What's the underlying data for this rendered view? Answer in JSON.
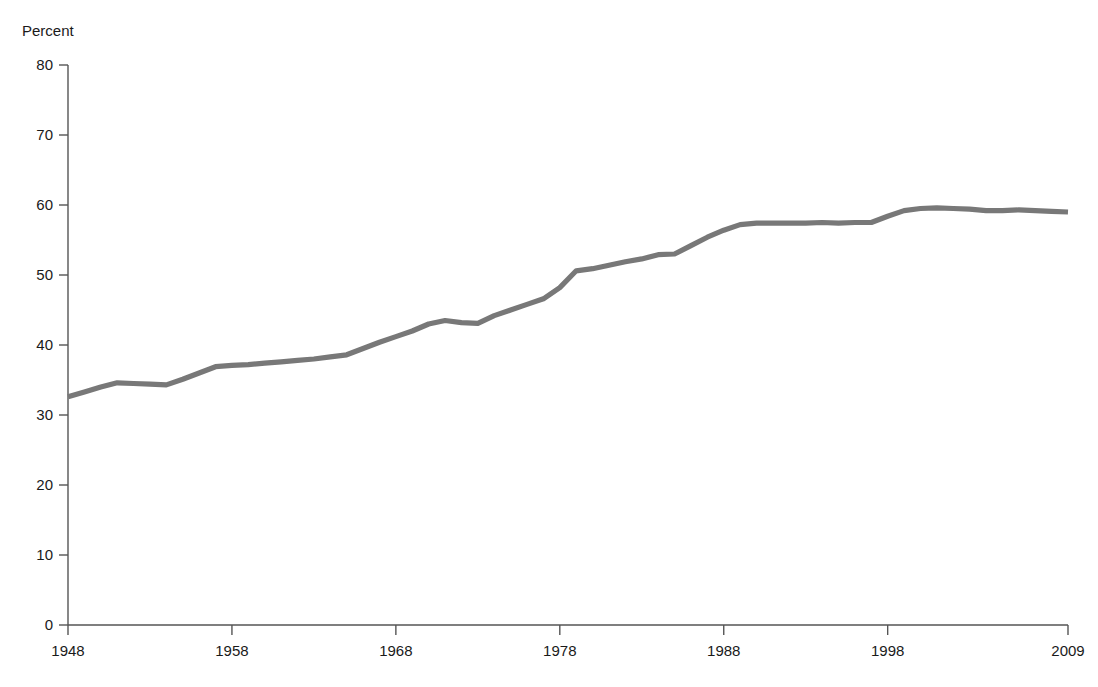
{
  "chart_data": {
    "type": "line",
    "title": "",
    "subtitle": "",
    "xlabel": "",
    "ylabel": "Percent",
    "ylim": [
      0,
      80
    ],
    "xlim": [
      1948,
      2009
    ],
    "grid": false,
    "legend": null,
    "line_color": "#787878",
    "axis_color": "#555555",
    "y_ticks": [
      0,
      10,
      20,
      30,
      40,
      50,
      60,
      70,
      80
    ],
    "y_tick_labels": [
      "0",
      "10",
      "20",
      "30",
      "40",
      "50",
      "60",
      "70",
      "80"
    ],
    "x_ticks": [
      1948,
      1958,
      1968,
      1978,
      1988,
      1998,
      2009
    ],
    "x_tick_labels": [
      "1948",
      "1958",
      "1968",
      "1978",
      "1988",
      "1998",
      "2009"
    ],
    "series": [
      {
        "name": "Percent",
        "x": [
          1948,
          1949,
          1950,
          1951,
          1952,
          1953,
          1954,
          1955,
          1956,
          1957,
          1958,
          1959,
          1960,
          1961,
          1962,
          1963,
          1964,
          1965,
          1966,
          1967,
          1968,
          1969,
          1970,
          1971,
          1972,
          1973,
          1974,
          1975,
          1976,
          1977,
          1978,
          1979,
          1980,
          1981,
          1982,
          1983,
          1984,
          1985,
          1986,
          1987,
          1988,
          1989,
          1990,
          1991,
          1992,
          1993,
          1994,
          1995,
          1996,
          1997,
          1998,
          1999,
          2000,
          2001,
          2002,
          2003,
          2004,
          2005,
          2006,
          2007,
          2008,
          2009
        ],
        "y": [
          32.6,
          33.3,
          34.0,
          34.6,
          34.5,
          34.4,
          34.3,
          35.1,
          36.0,
          36.9,
          37.1,
          37.2,
          37.4,
          37.6,
          37.8,
          38.0,
          38.3,
          38.6,
          39.5,
          40.4,
          41.2,
          42.0,
          43.0,
          43.5,
          43.2,
          43.1,
          44.2,
          45.0,
          45.8,
          46.6,
          48.2,
          50.6,
          50.9,
          51.4,
          51.9,
          52.3,
          52.9,
          53.0,
          54.2,
          55.4,
          56.4,
          57.2,
          57.4,
          57.4,
          57.4,
          57.4,
          57.5,
          57.4,
          57.5,
          57.5,
          58.4,
          59.2,
          59.5,
          59.6,
          59.5,
          59.4,
          59.2,
          59.2,
          59.3,
          59.2,
          59.1,
          59.0
        ]
      }
    ]
  }
}
